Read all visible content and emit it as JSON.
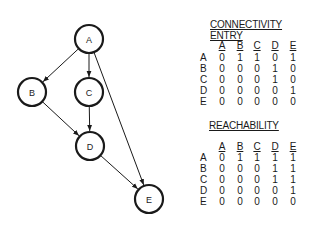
{
  "graph": {
    "nodes": [
      {
        "id": "A",
        "label": "A",
        "x": 89,
        "y": 39
      },
      {
        "id": "B",
        "label": "B",
        "x": 32,
        "y": 92
      },
      {
        "id": "C",
        "label": "C",
        "x": 89,
        "y": 92
      },
      {
        "id": "D",
        "label": "D",
        "x": 90,
        "y": 146
      },
      {
        "id": "E",
        "label": "E",
        "x": 149,
        "y": 199
      }
    ],
    "edges": [
      {
        "from": "A",
        "to": "B"
      },
      {
        "from": "A",
        "to": "C"
      },
      {
        "from": "A",
        "to": "E"
      },
      {
        "from": "B",
        "to": "D"
      },
      {
        "from": "C",
        "to": "D"
      },
      {
        "from": "D",
        "to": "E"
      }
    ],
    "node_radius": 14,
    "stroke_color": "#1a1a1a"
  },
  "connectivity": {
    "title_line1": "CONNECTIVITY",
    "title_line2": "ENTRY",
    "columns": [
      "A",
      "B",
      "C",
      "D",
      "E"
    ],
    "rows": [
      {
        "label": "A",
        "values": [
          "0",
          "1",
          "1",
          "0",
          "1"
        ]
      },
      {
        "label": "B",
        "values": [
          "0",
          "0",
          "0",
          "1",
          "0"
        ]
      },
      {
        "label": "C",
        "values": [
          "0",
          "0",
          "0",
          "1",
          "0"
        ]
      },
      {
        "label": "D",
        "values": [
          "0",
          "0",
          "0",
          "0",
          "1"
        ]
      },
      {
        "label": "E",
        "values": [
          "0",
          "0",
          "0",
          "0",
          "0"
        ]
      }
    ]
  },
  "reachability": {
    "title": "REACHABILITY",
    "columns": [
      "A",
      "B",
      "C",
      "D",
      "E"
    ],
    "rows": [
      {
        "label": "A",
        "values": [
          "0",
          "1",
          "1",
          "1",
          "1"
        ]
      },
      {
        "label": "B",
        "values": [
          "0",
          "0",
          "0",
          "1",
          "1"
        ]
      },
      {
        "label": "C",
        "values": [
          "0",
          "0",
          "0",
          "1",
          "1"
        ]
      },
      {
        "label": "D",
        "values": [
          "0",
          "0",
          "0",
          "0",
          "1"
        ]
      },
      {
        "label": "E",
        "values": [
          "0",
          "0",
          "0",
          "0",
          "0"
        ]
      }
    ]
  }
}
